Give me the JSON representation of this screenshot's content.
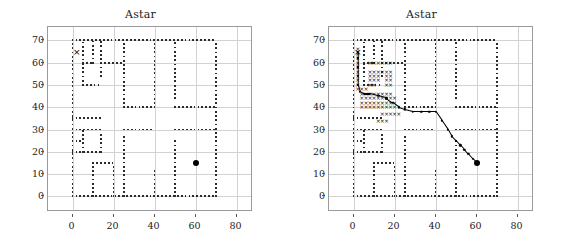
{
  "figure": {
    "width": 562,
    "height": 250,
    "background": "#ffffff",
    "grid_color": "#d2d2d2",
    "axis_color": "#9a9a9a",
    "obstacle_color": "#2b2b2b",
    "path_color": "#000000"
  },
  "panels": [
    {
      "id": "left",
      "title": "Astar",
      "shows_search": false
    },
    {
      "id": "right",
      "title": "Astar",
      "shows_search": true
    }
  ],
  "axis": {
    "xlabel": "",
    "ylabel": "",
    "xlim": [
      -12,
      88
    ],
    "ylim": [
      -7,
      76
    ],
    "xticks": [
      0,
      20,
      40,
      60,
      80
    ],
    "xticklabels": [
      "0",
      "20",
      "40",
      "60",
      "80"
    ],
    "yticks": [
      0,
      10,
      20,
      30,
      40,
      50,
      60,
      70
    ],
    "yticklabels": [
      "0",
      "10",
      "20",
      "30",
      "40",
      "50",
      "60",
      "70"
    ],
    "grid": true
  },
  "chart_data": {
    "type": "scatter",
    "title": "Astar",
    "xlabel": "",
    "ylabel": "",
    "xlim": [
      -12,
      88
    ],
    "ylim": [
      -7,
      76
    ],
    "xticks": [
      0,
      20,
      40,
      60,
      80
    ],
    "yticks": [
      0,
      10,
      20,
      30,
      40,
      50,
      60,
      70
    ],
    "grid": true,
    "legend": "none",
    "start": {
      "x": 2,
      "y": 65,
      "marker": "x",
      "label": "start"
    },
    "goal": {
      "x": 60,
      "y": 15,
      "marker": "o",
      "label": "goal"
    },
    "obstacles": {
      "description": "Dotted black wall segments forming a maze-like occupancy map",
      "horizontal_segments": [
        {
          "y": 70,
          "x0": 0,
          "x1": 70
        },
        {
          "y": 60,
          "x0": 5,
          "x1": 10
        },
        {
          "y": 60,
          "x0": 14,
          "x1": 25
        },
        {
          "y": 50,
          "x0": 5,
          "x1": 14
        },
        {
          "y": 40,
          "x0": 25,
          "x1": 40
        },
        {
          "y": 40,
          "x0": 50,
          "x1": 70
        },
        {
          "y": 35,
          "x0": 0,
          "x1": 14
        },
        {
          "y": 30,
          "x0": 0,
          "x1": 14
        },
        {
          "y": 30,
          "x0": 25,
          "x1": 40
        },
        {
          "y": 30,
          "x0": 50,
          "x1": 70
        },
        {
          "y": 25,
          "x0": 0,
          "x1": 5
        },
        {
          "y": 20,
          "x0": 0,
          "x1": 14
        },
        {
          "y": 15,
          "x0": 10,
          "x1": 20
        },
        {
          "y": 0,
          "x0": 0,
          "x1": 70
        }
      ],
      "vertical_segments": [
        {
          "x": 0,
          "y0": 0,
          "y1": 70
        },
        {
          "x": 5,
          "y0": 50,
          "y1": 70
        },
        {
          "x": 10,
          "y0": 60,
          "y1": 70
        },
        {
          "x": 14,
          "y0": 54,
          "y1": 70
        },
        {
          "x": 25,
          "y0": 40,
          "y1": 70
        },
        {
          "x": 25,
          "y0": 0,
          "y1": 28
        },
        {
          "x": 40,
          "y0": 40,
          "y1": 70
        },
        {
          "x": 40,
          "y0": 0,
          "y1": 12
        },
        {
          "x": 50,
          "y0": 44,
          "y1": 70
        },
        {
          "x": 50,
          "y0": 0,
          "y1": 26
        },
        {
          "x": 70,
          "y0": 0,
          "y1": 70
        },
        {
          "x": 5,
          "y0": 20,
          "y1": 30
        },
        {
          "x": 14,
          "y0": 20,
          "y1": 28
        },
        {
          "x": 10,
          "y0": 0,
          "y1": 15
        },
        {
          "x": 20,
          "y0": 0,
          "y1": 15
        }
      ]
    },
    "searched_nodes": {
      "marker": "x",
      "note": "Nodes expanded by A* in the right panel only",
      "points": [
        [
          2,
          66
        ],
        [
          2,
          64
        ],
        [
          2,
          62
        ],
        [
          2,
          60
        ],
        [
          2,
          58
        ],
        [
          2,
          56
        ],
        [
          2,
          54
        ],
        [
          2,
          52
        ],
        [
          2,
          50
        ],
        [
          4,
          48
        ],
        [
          2,
          48
        ],
        [
          6,
          48
        ],
        [
          8,
          60
        ],
        [
          10,
          60
        ],
        [
          12,
          60
        ],
        [
          14,
          60
        ],
        [
          16,
          60
        ],
        [
          18,
          60
        ],
        [
          8,
          56
        ],
        [
          10,
          56
        ],
        [
          12,
          56
        ],
        [
          14,
          56
        ],
        [
          16,
          56
        ],
        [
          18,
          56
        ],
        [
          8,
          54
        ],
        [
          10,
          54
        ],
        [
          12,
          54
        ],
        [
          16,
          54
        ],
        [
          18,
          54
        ],
        [
          8,
          52
        ],
        [
          10,
          52
        ],
        [
          12,
          52
        ],
        [
          16,
          52
        ],
        [
          18,
          52
        ],
        [
          8,
          50
        ],
        [
          10,
          50
        ],
        [
          16,
          50
        ],
        [
          18,
          50
        ],
        [
          4,
          46
        ],
        [
          6,
          46
        ],
        [
          8,
          46
        ],
        [
          10,
          46
        ],
        [
          12,
          46
        ],
        [
          14,
          46
        ],
        [
          16,
          46
        ],
        [
          18,
          46
        ],
        [
          4,
          44
        ],
        [
          6,
          44
        ],
        [
          8,
          44
        ],
        [
          10,
          44
        ],
        [
          12,
          44
        ],
        [
          14,
          44
        ],
        [
          16,
          44
        ],
        [
          18,
          44
        ],
        [
          20,
          44
        ],
        [
          4,
          42
        ],
        [
          6,
          42
        ],
        [
          8,
          42
        ],
        [
          10,
          42
        ],
        [
          12,
          42
        ],
        [
          14,
          42
        ],
        [
          16,
          42
        ],
        [
          18,
          42
        ],
        [
          20,
          42
        ],
        [
          4,
          40
        ],
        [
          6,
          40
        ],
        [
          8,
          40
        ],
        [
          10,
          40
        ],
        [
          12,
          40
        ],
        [
          14,
          40
        ],
        [
          16,
          40
        ],
        [
          18,
          40
        ],
        [
          20,
          40
        ],
        [
          14,
          37
        ],
        [
          16,
          37
        ],
        [
          18,
          37
        ],
        [
          20,
          37
        ],
        [
          22,
          37
        ],
        [
          12,
          34
        ],
        [
          14,
          34
        ],
        [
          16,
          34
        ]
      ]
    },
    "path": {
      "note": "Final A* route from start (2,65) to goal (60,15)",
      "points": [
        [
          2,
          65
        ],
        [
          2,
          62
        ],
        [
          2,
          58
        ],
        [
          2,
          54
        ],
        [
          2,
          50
        ],
        [
          3,
          47
        ],
        [
          5,
          46
        ],
        [
          8,
          46
        ],
        [
          12,
          45
        ],
        [
          16,
          44
        ],
        [
          19,
          42
        ],
        [
          22,
          40
        ],
        [
          25,
          39
        ],
        [
          29,
          38
        ],
        [
          33,
          38
        ],
        [
          37,
          38
        ],
        [
          40,
          38
        ],
        [
          43,
          34
        ],
        [
          46,
          30
        ],
        [
          48,
          27
        ],
        [
          50,
          25
        ],
        [
          52,
          23
        ],
        [
          54,
          21
        ],
        [
          56,
          19
        ],
        [
          58,
          17
        ],
        [
          60,
          15
        ]
      ]
    }
  }
}
